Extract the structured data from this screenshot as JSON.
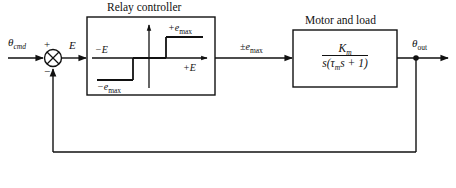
{
  "diagram": {
    "type": "control-system-block-diagram",
    "line_color": "#111111",
    "background": "#ffffff"
  },
  "input": {
    "signal_base": "θ",
    "signal_sub": "cmd",
    "label": "θcmd"
  },
  "summing_junction": {
    "name": "summing-junction",
    "plus_sign": "+",
    "minus_sign": "−"
  },
  "error_signal": {
    "label": "E"
  },
  "relay_block": {
    "title": "Relay controller",
    "plot": {
      "y_positive_label_base": "+e",
      "y_positive_label_sub": "max",
      "y_positive_label": "+emax",
      "y_negative_label_base": "−e",
      "y_negative_label_sub": "max",
      "y_negative_label": "−emax",
      "x_negative_label": "−E",
      "x_positive_label": "+E"
    }
  },
  "relay_output": {
    "label_base": "±e",
    "label_sub": "max",
    "label": "±emax"
  },
  "motor_block": {
    "title": "Motor and load",
    "transfer_function": {
      "numerator_base": "K",
      "numerator_sub": "m",
      "numerator": "Km",
      "denominator": "s(τm s + 1)",
      "denominator_parts": {
        "s1": "s(",
        "tau": "τ",
        "tau_sub": "m",
        "s2": "s + 1)"
      }
    }
  },
  "output": {
    "signal_base": "θ",
    "signal_sub": "out",
    "label": "θout"
  },
  "feedback": {
    "name": "unity-feedback-path",
    "tap_node": "output-junction-dot"
  }
}
